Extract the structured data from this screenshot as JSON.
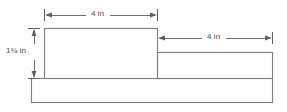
{
  "figure": {
    "type": "engineering-side-view-drawing",
    "background_color": "#ffffff",
    "line_color": "#7d7d7d",
    "dimension_color": "#5f5f5f",
    "text_color": "#4a4a4a"
  },
  "dimensions": {
    "top": {
      "label": "4 in",
      "value": 4,
      "unit": "in",
      "orientation": "horizontal",
      "measures": "upper-left-block-width"
    },
    "right": {
      "label": "4 in",
      "value": 4,
      "unit": "in",
      "orientation": "horizontal",
      "measures": "right-step-block-width"
    },
    "left": {
      "label": "1¾ in",
      "value": 1.75,
      "unit": "in",
      "orientation": "vertical",
      "measures": "upper-left-block-height"
    }
  },
  "shapes": {
    "upper_left_block": {
      "name": "upper-left-block"
    },
    "right_step_block": {
      "name": "right-step-block"
    },
    "base_bar": {
      "name": "base-bar"
    }
  }
}
